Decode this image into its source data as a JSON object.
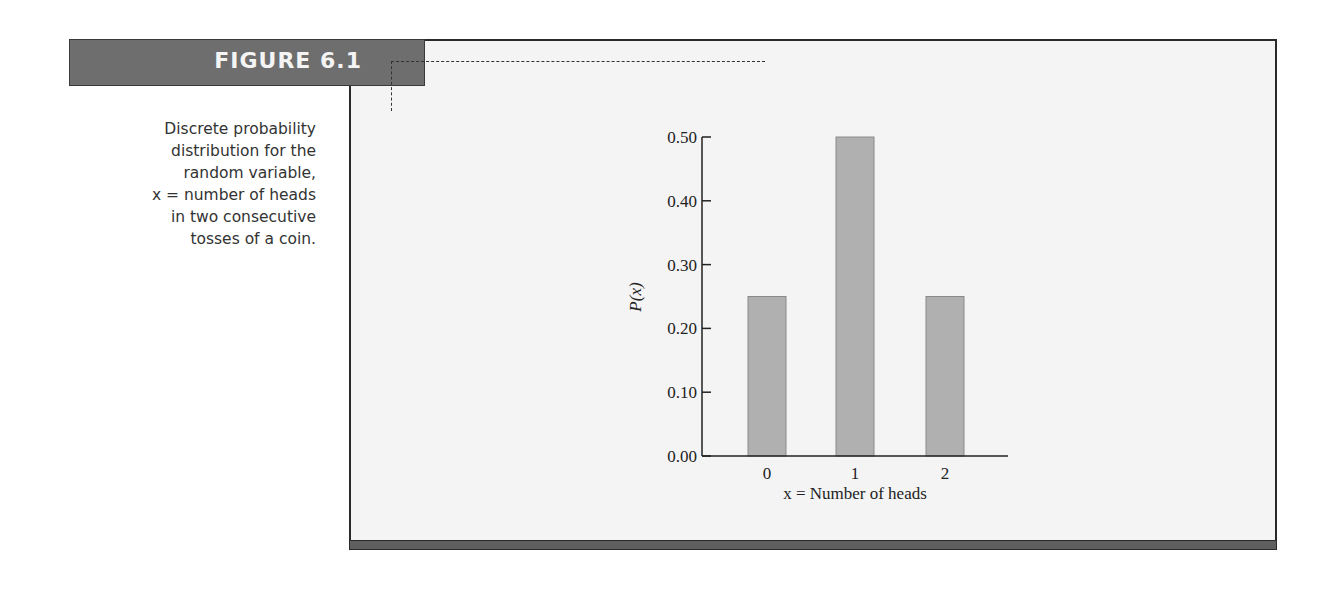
{
  "figure": {
    "label": "FIGURE 6.1",
    "caption_lines": [
      "Discrete probability",
      "distribution for the",
      "random variable,",
      "x = number of heads",
      "in two consecutive",
      "tosses of a coin."
    ],
    "colors": {
      "label_bar": "#6e6e6e",
      "panel_bg": "#f4f4f4",
      "bar_fill": "#b0b0b0",
      "border": "#2a2a2a"
    }
  },
  "chart_data": {
    "type": "bar",
    "title": "",
    "categories": [
      "0",
      "1",
      "2"
    ],
    "values": [
      0.25,
      0.5,
      0.25
    ],
    "xlabel": "x = Number of heads",
    "ylabel": "P(x)",
    "ylim": [
      0.0,
      0.5
    ],
    "yticks": [
      "0.00",
      "0.10",
      "0.20",
      "0.30",
      "0.40",
      "0.50"
    ],
    "grid": false,
    "legend": null
  }
}
